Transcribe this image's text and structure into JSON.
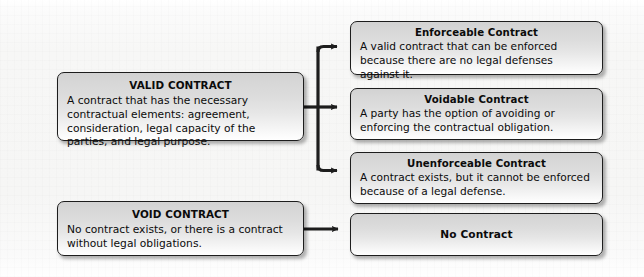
{
  "diagram": {
    "accent_color": "#1d1d1d",
    "box_fill_top": "#d2d2d2",
    "box_fill_bottom": "#ffffff",
    "background_color": "#f6f6f5",
    "left_nodes": [
      {
        "id": "valid-contract",
        "title": "VALID CONTRACT",
        "desc": "A contract that has the necessary contractual elements: agreement, consideration, legal capacity of the parties, and legal purpose."
      },
      {
        "id": "void-contract",
        "title": "VOID CONTRACT",
        "desc": "No contract exists, or there is a contract without legal obligations."
      }
    ],
    "right_nodes": [
      {
        "id": "enforceable-contract",
        "title": "Enforceable Contract",
        "desc": "A valid contract that can be enforced because there are no legal defenses against it."
      },
      {
        "id": "voidable-contract",
        "title": "Voidable Contract",
        "desc": "A party has the option of avoiding or enforcing the contractual obligation."
      },
      {
        "id": "unenforceable-contract",
        "title": "Unenforceable Contract",
        "desc": "A contract exists, but it cannot be enforced because of a legal defense."
      },
      {
        "id": "no-contract",
        "title": "No Contract",
        "desc": ""
      }
    ],
    "connectors": [
      {
        "from": "valid-contract",
        "to": "enforceable-contract",
        "style": "elbow-up"
      },
      {
        "from": "valid-contract",
        "to": "voidable-contract",
        "style": "straight"
      },
      {
        "from": "valid-contract",
        "to": "unenforceable-contract",
        "style": "elbow-down"
      },
      {
        "from": "void-contract",
        "to": "no-contract",
        "style": "straight"
      }
    ]
  }
}
